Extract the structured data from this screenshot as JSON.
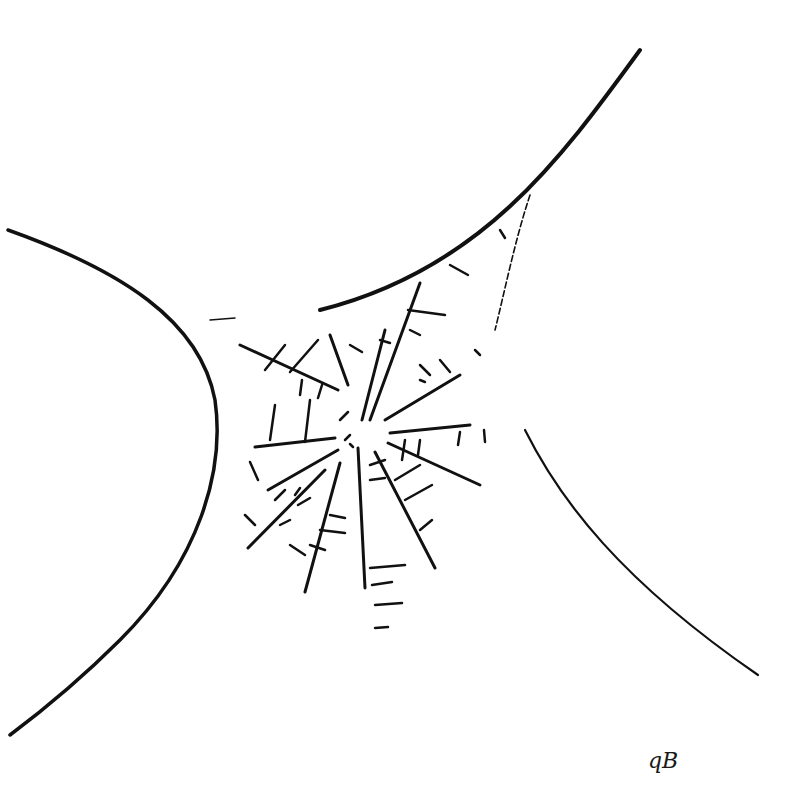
{
  "artwork": {
    "subject": "spider web sketch",
    "signature": "qB",
    "stroke_color": "#111111",
    "background": "#ffffff"
  }
}
